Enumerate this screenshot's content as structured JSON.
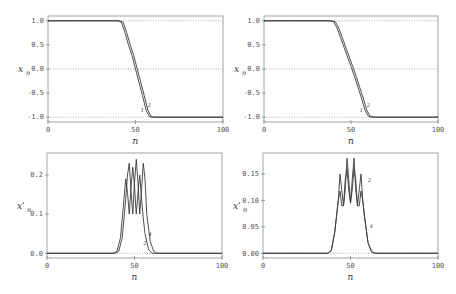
{
  "figure": {
    "panels": [
      {
        "id": "top-left",
        "ylabel": "x",
        "ylabel_sub": "n",
        "ylabel_prime": "",
        "xlabel": "n"
      },
      {
        "id": "top-right",
        "ylabel": "x",
        "ylabel_sub": "n",
        "ylabel_prime": "",
        "xlabel": "n"
      },
      {
        "id": "bottom-left",
        "ylabel": "x",
        "ylabel_sub": "n",
        "ylabel_prime": "'",
        "xlabel": "n"
      },
      {
        "id": "bottom-right",
        "ylabel": "x",
        "ylabel_sub": "n",
        "ylabel_prime": "'",
        "xlabel": "n"
      }
    ]
  },
  "chart_data": [
    {
      "type": "line",
      "panel": "top-left",
      "title": "",
      "xlabel": "n",
      "ylabel": "x_n",
      "xlim": [
        0,
        100
      ],
      "ylim": [
        -1.1,
        1.1
      ],
      "xticks": [
        0,
        50,
        100
      ],
      "xtick_labels": [
        "0",
        "50",
        "100"
      ],
      "yticks": [
        1.0,
        0.5,
        0.0,
        -0.5,
        -1.0
      ],
      "ytick_labels": [
        "1.0",
        "0.5",
        "0.0",
        "-0.5",
        "-1.0"
      ],
      "hlines_dotted": [
        1.0,
        0.0,
        -1.0
      ],
      "curve_labels": [
        {
          "text": "1",
          "x": 53,
          "y": -0.9
        },
        {
          "text": "2",
          "x": 57,
          "y": -0.78
        }
      ],
      "series": [
        {
          "name": "1",
          "x": [
            0,
            40,
            42,
            44,
            46,
            48,
            50,
            52,
            54,
            56,
            58,
            60,
            100
          ],
          "y": [
            1.0,
            1.0,
            0.97,
            0.75,
            0.5,
            0.28,
            0.0,
            -0.28,
            -0.55,
            -0.85,
            -0.99,
            -1.0,
            -1.0
          ]
        },
        {
          "name": "2",
          "x": [
            0,
            41,
            43,
            45,
            47,
            49,
            51,
            53,
            55,
            57,
            59,
            61,
            100
          ],
          "y": [
            1.0,
            1.0,
            0.97,
            0.75,
            0.5,
            0.28,
            0.0,
            -0.28,
            -0.55,
            -0.85,
            -0.99,
            -1.0,
            -1.0
          ]
        }
      ]
    },
    {
      "type": "line",
      "panel": "top-right",
      "title": "",
      "xlabel": "n",
      "ylabel": "x_n",
      "xlim": [
        0,
        100
      ],
      "ylim": [
        -1.1,
        1.1
      ],
      "xticks": [
        0,
        50,
        100
      ],
      "xtick_labels": [
        "0",
        "50",
        "100"
      ],
      "yticks": [
        1.0,
        0.5,
        0.0,
        -0.5,
        -1.0
      ],
      "ytick_labels": [
        "1.0",
        "0.5",
        "0.0",
        "-0.5",
        "-1.0"
      ],
      "hlines_dotted": [
        1.0,
        0.0,
        -1.0
      ],
      "curve_labels": [
        {
          "text": "1",
          "x": 55,
          "y": -0.9
        },
        {
          "text": "2",
          "x": 59,
          "y": -0.78
        }
      ],
      "series": [
        {
          "name": "1",
          "x": [
            0,
            38,
            40,
            42,
            44,
            46,
            48,
            50,
            52,
            54,
            56,
            58,
            60,
            62,
            100
          ],
          "y": [
            1.0,
            1.0,
            0.98,
            0.85,
            0.65,
            0.45,
            0.25,
            0.05,
            -0.15,
            -0.38,
            -0.6,
            -0.85,
            -0.98,
            -1.0,
            -1.0
          ]
        },
        {
          "name": "2",
          "x": [
            0,
            39,
            41,
            43,
            45,
            47,
            49,
            51,
            53,
            55,
            57,
            59,
            61,
            63,
            100
          ],
          "y": [
            1.0,
            1.0,
            0.98,
            0.85,
            0.65,
            0.45,
            0.25,
            0.05,
            -0.15,
            -0.38,
            -0.6,
            -0.85,
            -0.98,
            -1.0,
            -1.0
          ]
        }
      ]
    },
    {
      "type": "line",
      "panel": "bottom-left",
      "title": "",
      "xlabel": "n",
      "ylabel": "x'_n",
      "xlim": [
        0,
        100
      ],
      "ylim": [
        -0.012,
        0.256
      ],
      "xticks": [
        0,
        50,
        100
      ],
      "xtick_labels": [
        "0",
        "50",
        "100"
      ],
      "yticks": [
        0.2,
        0.1,
        0.0
      ],
      "ytick_labels": [
        "0.2",
        "0.1",
        "0.0"
      ],
      "hlines_dotted": [
        0.0
      ],
      "curve_labels": [
        {
          "text": "4",
          "x": 58,
          "y": 0.045
        },
        {
          "text": "2",
          "x": 55,
          "y": 0.022
        }
      ],
      "series": [
        {
          "name": "2",
          "x": [
            0,
            38,
            40,
            42,
            44,
            45,
            46,
            47,
            48,
            49,
            50,
            51,
            52,
            53,
            54,
            55,
            56,
            58,
            60,
            62,
            100
          ],
          "y": [
            0.0,
            0.0,
            0.005,
            0.04,
            0.14,
            0.19,
            0.155,
            0.1,
            0.17,
            0.22,
            0.17,
            0.1,
            0.155,
            0.2,
            0.14,
            0.09,
            0.05,
            0.01,
            0.0,
            0.0,
            0.0
          ]
        },
        {
          "name": "4",
          "x": [
            0,
            39,
            41,
            43,
            45,
            46,
            47,
            48,
            49,
            50,
            51,
            52,
            53,
            54,
            55,
            56,
            57,
            59,
            61,
            63,
            100
          ],
          "y": [
            0.0,
            0.0,
            0.005,
            0.04,
            0.14,
            0.2,
            0.23,
            0.16,
            0.1,
            0.18,
            0.24,
            0.18,
            0.1,
            0.16,
            0.23,
            0.19,
            0.1,
            0.03,
            0.005,
            0.0,
            0.0
          ]
        }
      ]
    },
    {
      "type": "line",
      "panel": "bottom-right",
      "title": "",
      "xlabel": "n",
      "ylabel": "x'_n",
      "xlim": [
        0,
        100
      ],
      "ylim": [
        -0.009,
        0.19
      ],
      "xticks": [
        0,
        50,
        100
      ],
      "xtick_labels": [
        "0",
        "50",
        "100"
      ],
      "yticks": [
        0.15,
        0.1,
        0.05,
        0.0
      ],
      "ytick_labels": [
        "0.15",
        "0.10",
        "0.05",
        "0.00"
      ],
      "hlines_dotted": [
        0.0
      ],
      "curve_labels": [
        {
          "text": "2",
          "x": 60,
          "y": 0.135
        },
        {
          "text": "4",
          "x": 61,
          "y": 0.048
        }
      ],
      "series": [
        {
          "name": "2",
          "x": [
            0,
            37,
            39,
            41,
            43,
            44,
            45,
            46,
            47,
            48,
            49,
            50,
            51,
            52,
            53,
            54,
            55,
            56,
            57,
            58,
            60,
            62,
            64,
            100
          ],
          "y": [
            0.0,
            0.0,
            0.005,
            0.04,
            0.1,
            0.118,
            0.09,
            0.09,
            0.14,
            0.16,
            0.12,
            0.095,
            0.12,
            0.16,
            0.14,
            0.09,
            0.09,
            0.118,
            0.1,
            0.07,
            0.02,
            0.003,
            0.0,
            0.0
          ]
        },
        {
          "name": "4",
          "x": [
            0,
            37,
            39,
            41,
            43,
            44,
            45,
            46,
            47,
            48,
            49,
            50,
            51,
            52,
            53,
            54,
            55,
            56,
            57,
            58,
            60,
            62,
            64,
            100
          ],
          "y": [
            0.0,
            0.0,
            0.005,
            0.04,
            0.1,
            0.15,
            0.12,
            0.09,
            0.12,
            0.18,
            0.14,
            0.095,
            0.14,
            0.18,
            0.12,
            0.09,
            0.12,
            0.15,
            0.1,
            0.07,
            0.02,
            0.003,
            0.0,
            0.0
          ]
        }
      ]
    }
  ],
  "layout": {
    "frames": [
      {
        "left": 48,
        "right": 223,
        "top": 16,
        "bottom": 122
      },
      {
        "left": 264,
        "right": 438,
        "top": 16,
        "bottom": 122
      },
      {
        "left": 47,
        "right": 222,
        "top": 153,
        "bottom": 258
      },
      {
        "left": 263,
        "right": 438,
        "top": 153,
        "bottom": 258
      }
    ],
    "colors": {
      "frame": "#8a8a8a",
      "curve": "#3a3a3a",
      "dotted": "#9a9a9a",
      "text": "#555555"
    }
  }
}
